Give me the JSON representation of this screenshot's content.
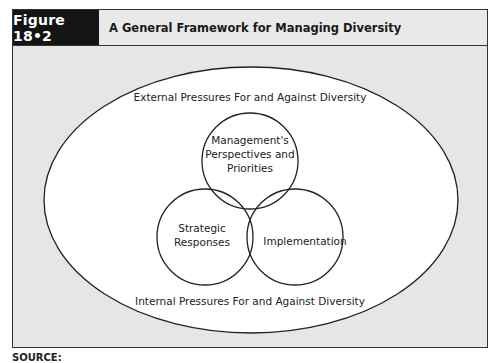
{
  "figure": {
    "label": "Figure 18•2",
    "title": "A General Framework for Managing Diversity"
  },
  "diagram": {
    "outer_ellipse": {
      "top_label": "External Pressures For and Against Diversity",
      "bottom_label": "Internal Pressures For and Against Diversity"
    },
    "circles": [
      {
        "id": "management",
        "lines": [
          "Management's",
          "Perspectives and",
          "Priorities"
        ]
      },
      {
        "id": "strategic",
        "lines": [
          "Strategic",
          "Responses"
        ]
      },
      {
        "id": "implementation",
        "lines": [
          "Implementation"
        ]
      }
    ]
  },
  "source": {
    "label": "SOURCE:"
  },
  "colors": {
    "header_bg": "#e9e9e9",
    "label_bg": "#141414",
    "frame_bg": "#e6e6e6",
    "ellipse_fill": "#ffffff",
    "stroke": "#222222"
  }
}
